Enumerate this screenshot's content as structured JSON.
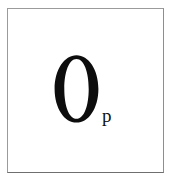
{
  "page": {
    "width": 173,
    "height": 182,
    "background_color": "#ffffff",
    "kind": "scanned-figure-fragment"
  },
  "frame": {
    "visible": true,
    "border_color": "#9b9b9b",
    "border_bottom_color": "#6f6f6f",
    "border_width_px": 1,
    "fill_color": "#ffffff"
  },
  "symbol": {
    "notation": "O_p",
    "base": {
      "text": "O",
      "role": "base-letter",
      "style": "didone-serif-capital",
      "color": "#0d0d0d"
    },
    "subscript": {
      "text": "p",
      "role": "subscript-letter",
      "style": "serif-lowercase",
      "color": "#111111"
    }
  }
}
